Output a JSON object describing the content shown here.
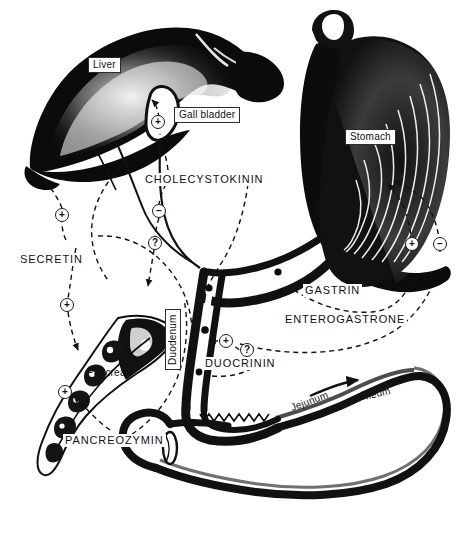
{
  "figure": {
    "background_color": "#ffffff",
    "ink_color": "#111111",
    "width": 467,
    "height": 533
  },
  "organs": [
    {
      "key": "liver",
      "label": "Liver",
      "boxed": true
    },
    {
      "key": "gall_bladder",
      "label": "Gall bladder",
      "boxed": true
    },
    {
      "key": "stomach",
      "label": "Stomach",
      "boxed": true
    },
    {
      "key": "pancreas",
      "label": "Pancreas",
      "boxed": false
    },
    {
      "key": "duodenum",
      "label": "Duodenum",
      "boxed": true
    },
    {
      "key": "jejunum",
      "label": "Jejunum",
      "boxed": false
    },
    {
      "key": "ileum",
      "label": "Ileum",
      "boxed": false
    }
  ],
  "hormones": [
    {
      "key": "cholecystokinin",
      "label": "CHOLECYSTOKININ"
    },
    {
      "key": "secretin",
      "label": "SECRETIN"
    },
    {
      "key": "pancreozymin",
      "label": "PANCREOZYMIN"
    },
    {
      "key": "duocrinin",
      "label": "DUOCRININ"
    },
    {
      "key": "gastrin",
      "label": "GASTRIN"
    },
    {
      "key": "enterogastrone",
      "label": "ENTEROGASTRONE"
    }
  ],
  "markers": [
    {
      "key": "chole_gallbladder_plus",
      "sign": "+",
      "hormone": "cholecystokinin",
      "target": "gall_bladder"
    },
    {
      "key": "chole_stomach_minus",
      "sign": "−",
      "hormone": "cholecystokinin",
      "target": "stomach"
    },
    {
      "key": "chole_unknown",
      "sign": "?",
      "hormone": "cholecystokinin",
      "target": "duodenum"
    },
    {
      "key": "secretin_liver_plus",
      "sign": "+",
      "hormone": "secretin",
      "target": "liver"
    },
    {
      "key": "secretin_pancreas_plus",
      "sign": "+",
      "hormone": "secretin",
      "target": "pancreas"
    },
    {
      "key": "pancreozymin_plus",
      "sign": "+",
      "hormone": "pancreozymin",
      "target": "pancreas"
    },
    {
      "key": "duocrinin_plus",
      "sign": "+",
      "hormone": "duocrinin",
      "target": "duodenum"
    },
    {
      "key": "duocrinin_unknown",
      "sign": "?",
      "hormone": "duocrinin",
      "target": "duodenum"
    },
    {
      "key": "gastrin_plus",
      "sign": "+",
      "hormone": "gastrin",
      "target": "stomach"
    },
    {
      "key": "enterogastrone_minus",
      "sign": "−",
      "hormone": "enterogastrone",
      "target": "stomach"
    }
  ],
  "legend_note": {
    "plus": "+",
    "minus": "−",
    "unknown": "?"
  }
}
